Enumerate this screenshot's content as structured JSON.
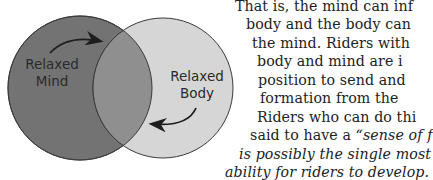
{
  "diagram": {
    "left_circle": {
      "label_line1": "Relaxed",
      "label_line2": "Mind",
      "fill": "#737373"
    },
    "right_circle": {
      "label_line1": "Relaxed",
      "label_line2": "Body",
      "fill": "#d6d6d6"
    },
    "overlap_fill": "#8f8f8f",
    "stroke": "#3a3a3a"
  },
  "text": {
    "lines": [
      {
        "text": "That is, the mind can inf",
        "italic": false
      },
      {
        "text": "body and the body can",
        "italic": false
      },
      {
        "text": "the mind. Riders with",
        "italic": false
      },
      {
        "text": "body and mind are i",
        "italic": false
      },
      {
        "text": "position to send and",
        "italic": false
      },
      {
        "text": "formation from the",
        "italic": false
      },
      {
        "text": "Riders who can do thi",
        "italic": false
      },
      {
        "text": "said to have a ",
        "italic": false,
        "italic_tail": "“sense of f"
      },
      {
        "text": "is possibly the single most",
        "italic": true
      },
      {
        "text": "ability for riders to develop.",
        "italic": true
      }
    ]
  }
}
